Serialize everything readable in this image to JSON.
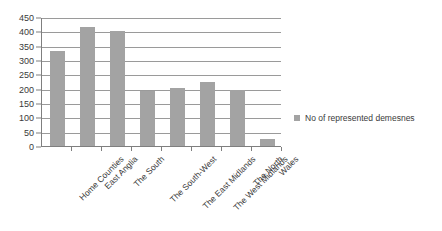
{
  "chart_data": {
    "type": "bar",
    "title": "",
    "subtitle": "",
    "xlabel": "",
    "ylabel": "",
    "ylim": [
      0,
      450
    ],
    "ytick_step": 50,
    "grid": true,
    "legend_position": "right",
    "bar_color": "#a3a3a3",
    "categories": [
      "Home Counties",
      "East Anglia",
      "The South",
      "The South-West",
      "The East Midlands",
      "The West Midlands",
      "The North",
      "Wales"
    ],
    "series": [
      {
        "name": "No of represented demesnes",
        "values": [
          330,
          415,
          400,
          193,
          202,
          225,
          195,
          25
        ]
      }
    ],
    "yticks": [
      "0",
      "50",
      "100",
      "150",
      "200",
      "250",
      "300",
      "350",
      "400",
      "450"
    ]
  },
  "legend": {
    "entries": [
      {
        "label": "No of represented demesnes",
        "color": "#a3a3a3"
      }
    ]
  }
}
